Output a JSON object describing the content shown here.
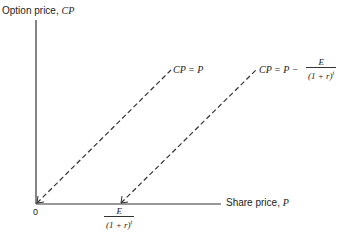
{
  "diagram": {
    "y_axis_label": "Option price, ",
    "y_axis_var": "CP",
    "x_axis_label": "Share price, ",
    "x_axis_var": "P",
    "origin_label": "0",
    "line1": {
      "label": "CP = P"
    },
    "line2": {
      "label_prefix": "CP = P −",
      "frac_num": "E",
      "frac_den": "(1 + r)",
      "frac_exp": "t"
    },
    "x_marker": {
      "frac_num": "E",
      "frac_den": "(1 + r)",
      "frac_exp": "t"
    },
    "colors": {
      "axis": "#333333",
      "dash": "#333333"
    }
  }
}
